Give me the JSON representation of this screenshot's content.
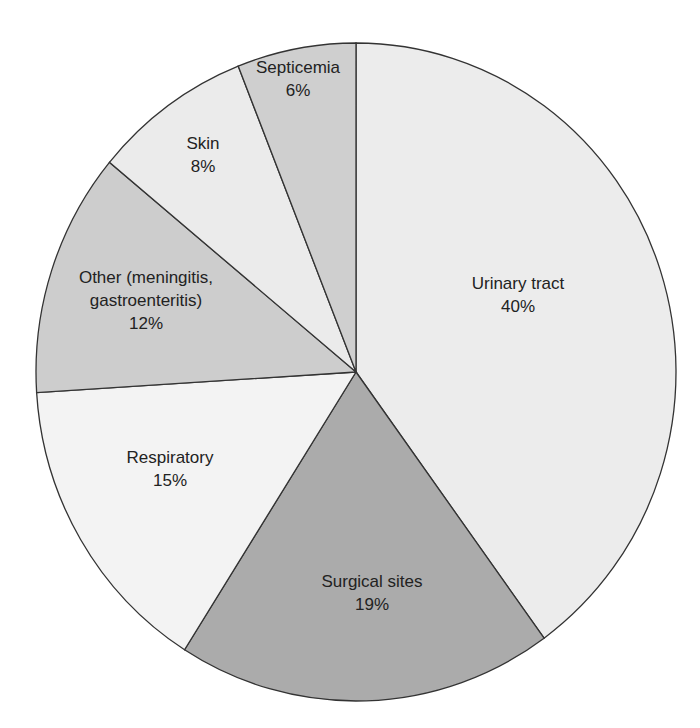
{
  "chart_data": {
    "type": "pie",
    "title": "",
    "categories": [
      "Urinary tract",
      "Surgical sites",
      "Respiratory",
      "Other (meningitis, gastroenteritis)",
      "Skin",
      "Septicemia"
    ],
    "values": [
      40,
      19,
      15,
      12,
      8,
      6
    ],
    "unit": "%",
    "start_angle": "12 o'clock, clockwise",
    "legend": "none (labels inside slices)",
    "slices": [
      {
        "label_lines": [
          "Urinary tract",
          "40%"
        ],
        "value": 40,
        "color": "#ececec",
        "label_pos": [
          518,
          300
        ]
      },
      {
        "label_lines": [
          "Surgical sites",
          "19%"
        ],
        "value": 19,
        "color": "#ababab",
        "label_pos": [
          372,
          598
        ]
      },
      {
        "label_lines": [
          "Respiratory",
          "15%"
        ],
        "value": 15,
        "color": "#f3f3f3",
        "label_pos": [
          170,
          474
        ]
      },
      {
        "label_lines": [
          "Other (meningitis,",
          "gastroenteritis)",
          "12%"
        ],
        "value": 12,
        "color": "#cdcdcd",
        "label_pos": [
          146,
          306
        ]
      },
      {
        "label_lines": [
          "Skin",
          "8%"
        ],
        "value": 8,
        "color": "#ebebeb",
        "label_pos": [
          203,
          160
        ]
      },
      {
        "label_lines": [
          "Septicemia",
          "6%"
        ],
        "value": 6,
        "color": "#cfcfcf",
        "label_pos": [
          298,
          84
        ]
      }
    ]
  },
  "geometry": {
    "cx": 356,
    "cy": 372,
    "rx": 320,
    "ry": 329
  },
  "colors": {
    "outline": "#333333",
    "text": "#222222",
    "background": "#ffffff"
  }
}
